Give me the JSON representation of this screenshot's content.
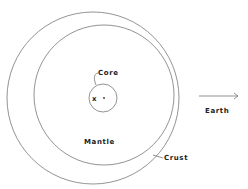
{
  "diagram": {
    "labels": {
      "core": "Core",
      "mantle": "Mantle",
      "crust": "Crust",
      "earth": "Earth",
      "marker_x": "x"
    },
    "shapes": {
      "outer_circle": {
        "cx": 93,
        "cy": 98,
        "r": 86
      },
      "mantle_circle": {
        "cx": 104,
        "cy": 95,
        "r": 70
      },
      "core_circle": {
        "cx": 103,
        "cy": 98,
        "r": 14
      }
    },
    "arrow": {
      "direction": "right"
    },
    "colors": {
      "line": "#777777",
      "text": "#222222",
      "background": "#ffffff"
    }
  }
}
